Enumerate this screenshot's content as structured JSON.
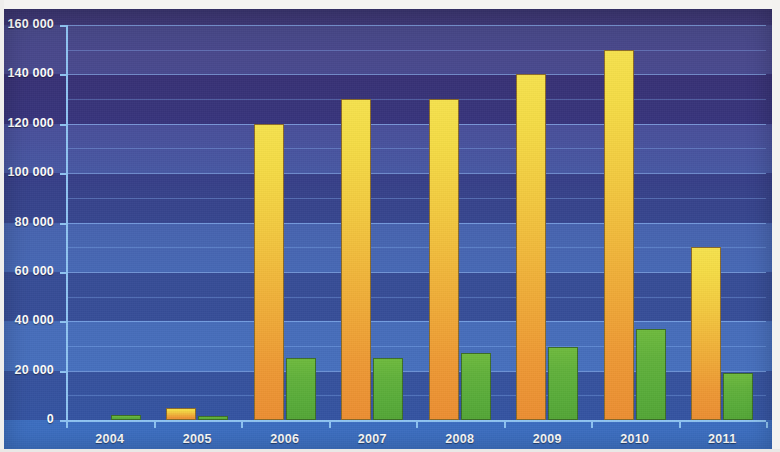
{
  "chart_data": {
    "type": "bar",
    "title": "",
    "subtitle": "",
    "xlabel": "",
    "ylabel": "",
    "categories": [
      "2004",
      "2005",
      "2006",
      "2007",
      "2008",
      "2009",
      "2010",
      "2011"
    ],
    "series": [
      {
        "name": "series-orange",
        "color": "#F0B13C",
        "values": [
          0,
          5000,
          120000,
          130000,
          130000,
          140000,
          150000,
          70000
        ]
      },
      {
        "name": "series-green",
        "color": "#5CB03C",
        "values": [
          2000,
          1500,
          25000,
          25000,
          27000,
          29500,
          37000,
          19000
        ]
      }
    ],
    "ylim": [
      0,
      160000
    ],
    "ytick_step": 20000,
    "yminor_step": 10000,
    "ytick_labels": [
      "0",
      "20 000",
      "40 000",
      "60 000",
      "80 000",
      "100 000",
      "120 000",
      "140 000",
      "160 000"
    ],
    "ytick_values": [
      0,
      20000,
      40000,
      60000,
      80000,
      100000,
      120000,
      140000,
      160000
    ],
    "grid": true,
    "grid_minor": true,
    "legend": false,
    "legend_position": "none",
    "plot_background": "#3F57A3",
    "banded_background": true,
    "axis_color": "#8FC4F2",
    "label_color": "#FFFFFF"
  }
}
